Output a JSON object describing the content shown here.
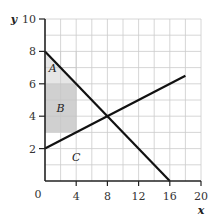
{
  "chart_data": {
    "type": "line",
    "title": "",
    "xlabel": "x",
    "ylabel": "y",
    "xlim": [
      0,
      20
    ],
    "ylim": [
      0,
      10
    ],
    "x_ticks": [
      0,
      4,
      8,
      12,
      16,
      20
    ],
    "y_ticks": [
      0,
      2,
      4,
      6,
      8,
      10
    ],
    "x_tick_labels": [
      "0",
      "4",
      "8",
      "12",
      "16",
      "20"
    ],
    "y_tick_labels": [
      "2",
      "4",
      "6",
      "8",
      "10"
    ],
    "origin_label": "0",
    "grid": true,
    "grid_x_step": 2,
    "grid_y_step": 1,
    "series": [
      {
        "name": "downward line",
        "points": [
          [
            0,
            8
          ],
          [
            16,
            0
          ]
        ],
        "color": "#111111"
      },
      {
        "name": "upward line",
        "points": [
          [
            0,
            2
          ],
          [
            18,
            6.5
          ]
        ],
        "color": "#111111"
      }
    ],
    "regions": [
      {
        "label": "A",
        "shape": "triangle",
        "points": [
          [
            0,
            8
          ],
          [
            0,
            6
          ],
          [
            4,
            6
          ]
        ],
        "fill": "#e6e6e6",
        "label_at": [
          1,
          7
        ]
      },
      {
        "label": "B",
        "shape": "rectangle",
        "points": [
          [
            0,
            3
          ],
          [
            4,
            3
          ],
          [
            4,
            6
          ],
          [
            0,
            6
          ]
        ],
        "fill": "#d0d0d0",
        "label_at": [
          2,
          4.5
        ]
      },
      {
        "label": "C",
        "shape": "unshaded",
        "points": [],
        "fill": "none",
        "label_at": [
          4,
          1.5
        ]
      }
    ],
    "intersection": [
      8,
      4
    ]
  },
  "colors": {
    "axis": "#222222",
    "grid": "#cccccc",
    "line": "#111111"
  }
}
